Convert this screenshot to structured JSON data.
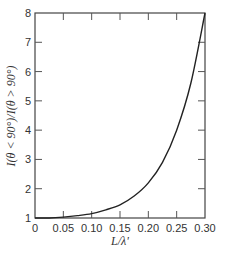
{
  "chart_data": {
    "type": "line",
    "title": "",
    "xlabel": "L/λ'",
    "ylabel": "I(θ < 90°)/I(θ > 90°)",
    "xlim": [
      0,
      0.3
    ],
    "ylim": [
      1,
      8
    ],
    "grid": false,
    "legend": null,
    "x_ticks": [
      "0",
      "0.05",
      "0.10",
      "0.15",
      "0.20",
      "0.25",
      "0.30"
    ],
    "y_ticks": [
      "1",
      "2",
      "3",
      "4",
      "5",
      "6",
      "7",
      "8"
    ],
    "series": [
      {
        "name": "intensity ratio",
        "x": [
          0,
          0.025,
          0.05,
          0.075,
          0.1,
          0.125,
          0.15,
          0.175,
          0.2,
          0.225,
          0.25,
          0.275,
          0.3
        ],
        "y": [
          1.0,
          1.0,
          1.03,
          1.08,
          1.15,
          1.28,
          1.45,
          1.75,
          2.2,
          2.9,
          4.0,
          5.6,
          8.0
        ]
      }
    ],
    "color": "#222222"
  }
}
